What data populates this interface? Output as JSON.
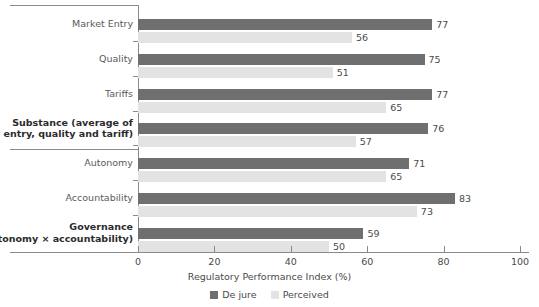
{
  "chart_data": {
    "type": "bar",
    "orientation": "horizontal",
    "title": "",
    "xlabel": "Regulatory Performance Index (%)",
    "ylabel": "",
    "xlim": [
      0,
      100
    ],
    "xticks": [
      0,
      20,
      40,
      60,
      80,
      100
    ],
    "grid": false,
    "legend_position": "bottom",
    "categories": [
      "Market Entry",
      "Quality",
      "Tariffs",
      "Substance (average of market entry, quality and tariff)",
      "Autonomy",
      "Accountability",
      "Governance (autonomy × accountability)"
    ],
    "category_lines": [
      [
        "Market Entry"
      ],
      [
        "Quality"
      ],
      [
        "Tariffs"
      ],
      [
        "Substance (average of",
        "market entry, quality and tariff)"
      ],
      [
        "Autonomy"
      ],
      [
        "Accountability"
      ],
      [
        "Governance",
        "(autonomy × accountability)"
      ]
    ],
    "category_emphasis": [
      false,
      false,
      false,
      true,
      false,
      false,
      true
    ],
    "series": [
      {
        "name": "De jure",
        "color": "#6f6f6f",
        "values": [
          77,
          75,
          77,
          76,
          71,
          83,
          59
        ]
      },
      {
        "name": "Perceived",
        "color": "#e3e3e3",
        "values": [
          56,
          51,
          65,
          57,
          65,
          73,
          50
        ]
      }
    ]
  },
  "legend": {
    "items": [
      {
        "label": "De jure",
        "color": "#6f6f6f"
      },
      {
        "label": "Perceived",
        "color": "#e3e3e3"
      }
    ]
  },
  "axis": {
    "x_title": "Regulatory Performance Index (%)",
    "x_tick_labels": [
      "0",
      "20",
      "40",
      "60",
      "80",
      "100"
    ]
  },
  "value_labels": {
    "de_jure": [
      "77",
      "75",
      "77",
      "76",
      "71",
      "83",
      "59"
    ],
    "perceived": [
      "56",
      "51",
      "65",
      "57",
      "65",
      "73",
      "50"
    ]
  }
}
